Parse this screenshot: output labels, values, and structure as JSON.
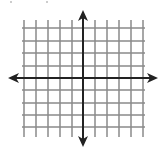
{
  "diagram": {
    "type": "coordinate-plane",
    "colors": {
      "background": "#ffffff",
      "grid": "#8a8a8a",
      "axis": "#222222"
    },
    "grid": {
      "vertical_lines_x": [
        24,
        36,
        48,
        60,
        72,
        95,
        107,
        119,
        131,
        143
      ],
      "horizontal_lines_y": [
        28,
        41,
        53,
        66,
        90,
        103,
        115,
        127
      ],
      "x_extent": [
        22,
        145
      ],
      "y_extent": [
        20,
        137
      ]
    },
    "axes": {
      "x_axis": {
        "y": 78,
        "x_start": 8,
        "x_end": 158,
        "arrows": "both"
      },
      "y_axis": {
        "x": 83,
        "y_start": 10,
        "y_end": 147,
        "arrows": "both"
      }
    }
  }
}
